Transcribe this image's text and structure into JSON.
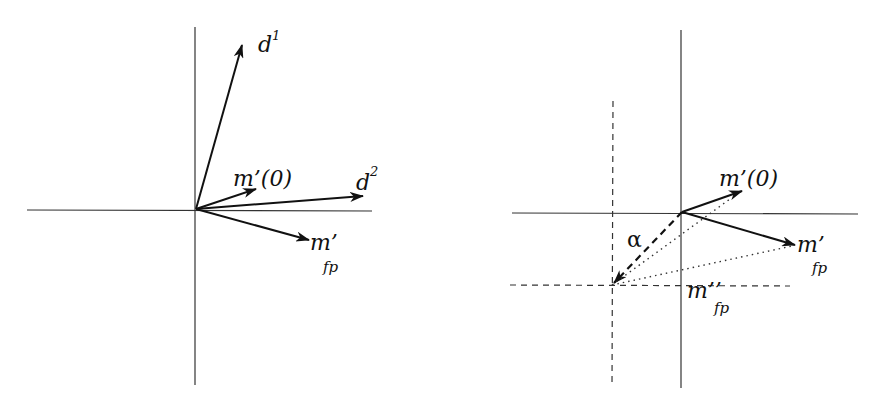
{
  "colors": {
    "ink": "#111111",
    "axis": "#333333",
    "background": "#ffffff"
  },
  "left_panel": {
    "labels": {
      "d1_base": "d",
      "d1_sup": "1",
      "d2_base": "d",
      "d2_sup": "2",
      "m0": "m’(0)",
      "mfp_base": "m’",
      "mfp_sub": "fp"
    },
    "vectors": [
      {
        "name": "d1",
        "from": [
          196,
          209
        ],
        "to": [
          242,
          45
        ],
        "style": "solid"
      },
      {
        "name": "d2",
        "from": [
          196,
          209
        ],
        "to": [
          363,
          196
        ],
        "style": "solid"
      },
      {
        "name": "m0",
        "from": [
          196,
          209
        ],
        "to": [
          256,
          189
        ],
        "style": "solid"
      },
      {
        "name": "mfp",
        "from": [
          196,
          209
        ],
        "to": [
          309,
          240
        ],
        "style": "solid"
      }
    ]
  },
  "right_panel": {
    "labels": {
      "m0": "m’(0)",
      "mfp_base": "m’",
      "mfp_sub": "fp",
      "mfp2_base": "m’’",
      "mfp2_sub": "fp",
      "alpha": "α"
    },
    "vectors": [
      {
        "name": "m0",
        "from": [
          682,
          212
        ],
        "to": [
          742,
          191
        ],
        "style": "solid"
      },
      {
        "name": "mfp",
        "from": [
          682,
          212
        ],
        "to": [
          795,
          245
        ],
        "style": "solid"
      },
      {
        "name": "alpha",
        "from": [
          682,
          212
        ],
        "to": [
          614,
          283
        ],
        "style": "dashed"
      },
      {
        "name": "m0-shifted",
        "from": [
          612,
          285
        ],
        "to": [
          730,
          199
        ],
        "style": "dotted"
      },
      {
        "name": "mfp-shifted",
        "from": [
          612,
          285
        ],
        "to": [
          792,
          246
        ],
        "style": "dotted"
      }
    ]
  }
}
